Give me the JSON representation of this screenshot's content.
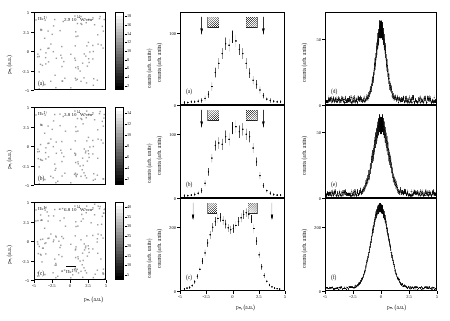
{
  "figure": {
    "type": "scientific-figure"
  },
  "axes": {
    "x_label_left": "pₙₓ (a.u.)",
    "y_label_left": "pₙᵧ (a.u.)",
    "x_label_middle": "pₙᵧ (a.u.)",
    "x_label_right": "pₙₓ (a.u.)",
    "y_label_counts": "counts (arb. units)",
    "colorbar_label": "counts (arb. units)",
    "x_ticks": [
      "-5",
      "-2.5",
      "0",
      "2.5",
      "5"
    ],
    "y_ticks_left": [
      "5",
      "2.5",
      "0",
      "-2.5",
      "-5"
    ],
    "x_range": [
      -6,
      6
    ],
    "y_range": [
      -6,
      6
    ]
  },
  "left_panels": [
    {
      "id": "a",
      "label": "(a)",
      "species": "He²⁺",
      "intensity": "2.9 10¹⁴ W/cm²",
      "intensity_mantissa": "2.9",
      "intensity_base": "10",
      "intensity_exponent": "14",
      "intensity_unit": "W/cm²",
      "colorbar_ticks": [
        "18",
        "16",
        "14",
        "12",
        "10",
        "8",
        "6",
        "4",
        "2"
      ],
      "colorbar_max": 18,
      "extra_label": ""
    },
    {
      "id": "b",
      "label": "(b)",
      "species": "He²⁺",
      "intensity": "3.8 10¹⁴ W/cm²",
      "intensity_mantissa": "3.8",
      "intensity_base": "10",
      "intensity_exponent": "14",
      "intensity_unit": "W/cm²",
      "colorbar_ticks": [
        "14",
        "12",
        "10",
        "8",
        "6",
        "4",
        "2"
      ],
      "colorbar_max": 14,
      "extra_label": ""
    },
    {
      "id": "c",
      "label": "(c)",
      "species": "He²⁺",
      "intensity": "6.8 10¹⁴ W/cm²",
      "intensity_mantissa": "6.8",
      "intensity_base": "10",
      "intensity_exponent": "14",
      "intensity_unit": "W/cm²",
      "colorbar_ticks": [
        "40",
        "35",
        "30",
        "25",
        "20",
        "15",
        "10",
        "5"
      ],
      "colorbar_max": 40,
      "extra_label": "He²⁺"
    }
  ],
  "chart_data": [
    {
      "type": "scatter",
      "panel": "a",
      "title": "",
      "xlabel": "pₙᵧ (a.u.)",
      "ylabel": "counts (arb. units)",
      "xlim": [
        -6,
        6
      ],
      "ylim": [
        0,
        130
      ],
      "y_ticks": [
        "0",
        "100"
      ],
      "arrows_at": [
        -3.6,
        3.6
      ],
      "hatch_regions": [
        [
          -2.9,
          -1.6
        ],
        [
          1.6,
          2.9
        ]
      ],
      "x": [
        -5.6,
        -5.2,
        -4.8,
        -4.4,
        -4.0,
        -3.6,
        -3.2,
        -2.8,
        -2.4,
        -2.0,
        -1.6,
        -1.2,
        -0.8,
        -0.4,
        0.0,
        0.4,
        0.8,
        1.2,
        1.6,
        2.0,
        2.4,
        2.8,
        3.2,
        3.6,
        4.0,
        4.4,
        4.8,
        5.2,
        5.6
      ],
      "y": [
        2,
        2,
        3,
        3,
        4,
        5,
        8,
        14,
        25,
        45,
        58,
        72,
        86,
        84,
        96,
        90,
        78,
        72,
        58,
        44,
        34,
        28,
        20,
        12,
        7,
        5,
        4,
        3,
        3
      ],
      "yerr": [
        2,
        2,
        2,
        2,
        3,
        3,
        4,
        5,
        6,
        7,
        8,
        8,
        9,
        9,
        9,
        9,
        8,
        8,
        8,
        7,
        6,
        6,
        5,
        4,
        3,
        3,
        2,
        2,
        2
      ]
    },
    {
      "type": "scatter",
      "panel": "b",
      "title": "",
      "xlabel": "pₙᵧ (a.u.)",
      "ylabel": "counts (arb. units)",
      "xlim": [
        -6,
        6
      ],
      "ylim": [
        0,
        145
      ],
      "y_ticks": [
        "0",
        "100"
      ],
      "arrows_at": [
        -3.6,
        3.6
      ],
      "hatch_regions": [
        [
          -2.9,
          -1.6
        ],
        [
          1.6,
          2.9
        ]
      ],
      "x": [
        -5.6,
        -5.2,
        -4.8,
        -4.4,
        -4.0,
        -3.6,
        -3.2,
        -2.8,
        -2.4,
        -2.0,
        -1.6,
        -1.2,
        -0.8,
        -0.4,
        0.0,
        0.4,
        0.8,
        1.2,
        1.6,
        2.0,
        2.4,
        2.8,
        3.2,
        3.6,
        4.0,
        4.4,
        4.8,
        5.2,
        5.6
      ],
      "y": [
        2,
        2,
        3,
        4,
        6,
        10,
        22,
        40,
        62,
        82,
        86,
        84,
        96,
        92,
        110,
        112,
        104,
        108,
        100,
        96,
        78,
        56,
        34,
        18,
        10,
        6,
        4,
        3,
        3
      ],
      "yerr": [
        2,
        2,
        2,
        3,
        3,
        4,
        5,
        6,
        7,
        8,
        9,
        9,
        10,
        10,
        10,
        10,
        10,
        10,
        9,
        9,
        8,
        7,
        6,
        4,
        3,
        3,
        2,
        2,
        2
      ]
    },
    {
      "type": "scatter",
      "panel": "c",
      "title": "",
      "xlabel": "pₙᵧ (a.u.)",
      "ylabel": "counts (arb. units)",
      "xlim": [
        -6,
        6
      ],
      "ylim": [
        0,
        290
      ],
      "y_ticks": [
        "0",
        "200"
      ],
      "arrows_at": [
        -4.6,
        4.6
      ],
      "hatch_regions": [
        [
          -2.9,
          -1.8
        ],
        [
          1.8,
          2.9
        ]
      ],
      "x": [
        -5.6,
        -5.3,
        -5.0,
        -4.7,
        -4.4,
        -4.1,
        -3.8,
        -3.5,
        -3.2,
        -2.9,
        -2.6,
        -2.3,
        -2.0,
        -1.7,
        -1.4,
        -1.1,
        -0.8,
        -0.5,
        -0.2,
        0.1,
        0.4,
        0.7,
        1.0,
        1.3,
        1.6,
        1.9,
        2.2,
        2.5,
        2.8,
        3.1,
        3.4,
        3.7,
        4.0,
        4.3,
        4.6,
        4.9,
        5.2,
        5.5
      ],
      "y": [
        4,
        6,
        8,
        14,
        26,
        44,
        66,
        92,
        118,
        150,
        176,
        200,
        218,
        228,
        232,
        222,
        210,
        198,
        192,
        196,
        206,
        218,
        230,
        240,
        246,
        240,
        226,
        196,
        156,
        112,
        74,
        46,
        28,
        16,
        10,
        6,
        4,
        3
      ],
      "yerr": [
        3,
        3,
        4,
        5,
        6,
        8,
        9,
        10,
        11,
        12,
        13,
        14,
        14,
        14,
        14,
        14,
        14,
        13,
        13,
        13,
        13,
        14,
        14,
        14,
        14,
        14,
        13,
        13,
        12,
        10,
        9,
        7,
        5,
        4,
        3,
        3,
        2,
        2
      ]
    },
    {
      "type": "line",
      "panel": "d",
      "title": "",
      "xlabel": "pₙₓ (a.u.)",
      "ylabel": "counts (arb. units)",
      "xlim": [
        -6,
        6
      ],
      "ylim": [
        0,
        70
      ],
      "y_ticks": [
        "0",
        "50"
      ],
      "peak_center": 0.0,
      "peak_height": 55,
      "peak_width": 0.55,
      "noise_level": 3
    },
    {
      "type": "line",
      "panel": "e",
      "title": "",
      "xlabel": "pₙₓ (a.u.)",
      "ylabel": "counts (arb. units)",
      "xlim": [
        -6,
        6
      ],
      "ylim": [
        0,
        70
      ],
      "y_ticks": [
        "0",
        "50"
      ],
      "peak_center": 0.0,
      "peak_height": 54,
      "peak_width": 0.8,
      "noise_level": 2.5
    },
    {
      "type": "line",
      "panel": "f",
      "title": "",
      "xlabel": "pₙₓ (a.u.)",
      "ylabel": "counts (arb. units)",
      "xlim": [
        -6,
        6
      ],
      "ylim": [
        0,
        290
      ],
      "y_ticks": [
        "0",
        "200"
      ],
      "peak_center": -0.1,
      "peak_height": 258,
      "peak_width": 0.95,
      "noise_level": 6
    }
  ],
  "right_panels": [
    {
      "id": "d",
      "label": "(d)"
    },
    {
      "id": "e",
      "label": "(e)"
    },
    {
      "id": "f",
      "label": "(f)"
    }
  ]
}
